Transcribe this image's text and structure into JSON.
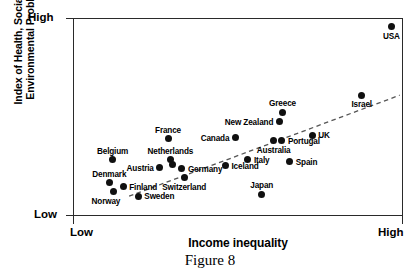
{
  "axes": {
    "y_title": "Index of Health, Social and\nEnvironmental Problems",
    "x_title": "Income inequality",
    "y_high": "High",
    "y_low": "Low",
    "x_low": "Low",
    "x_high": "High"
  },
  "caption": "Figure 8",
  "colors": {
    "point": "#101010",
    "frame": "#2a2a2a",
    "trend": "#555555",
    "background": "#ffffff"
  },
  "chart_data": {
    "type": "scatter",
    "title": "Figure 8",
    "xlabel": "Income inequality",
    "ylabel": "Index of Health, Social and Environmental Problems",
    "xlim": [
      "Low",
      "High"
    ],
    "ylim": [
      "Low",
      "High"
    ],
    "xtick_labels": [
      "Low",
      "High"
    ],
    "ytick_labels": [
      "Low",
      "High"
    ],
    "grid": false,
    "legend": "none",
    "trendline": {
      "type": "dashed-linear",
      "description": "Dashed positive regression line rising from lower-left to upper-right",
      "x0": 0.17,
      "y0": 0.1,
      "x1": 0.99,
      "y1": 0.61
    },
    "points": [
      {
        "name": "USA",
        "x": 0.965,
        "y": 0.955,
        "label_pos": "below"
      },
      {
        "name": "Israel",
        "x": 0.875,
        "y": 0.61,
        "label_pos": "below"
      },
      {
        "name": "Greece",
        "x": 0.635,
        "y": 0.525,
        "label_pos": "above"
      },
      {
        "name": "New Zealand",
        "x": 0.625,
        "y": 0.475,
        "label_pos": "left"
      },
      {
        "name": "UK",
        "x": 0.725,
        "y": 0.408,
        "label_pos": "right"
      },
      {
        "name": "Canada",
        "x": 0.492,
        "y": 0.395,
        "label_pos": "left"
      },
      {
        "name": "Australia",
        "x": 0.608,
        "y": 0.38,
        "label_pos": "below"
      },
      {
        "name": "Portugal",
        "x": 0.633,
        "y": 0.38,
        "label_pos": "right"
      },
      {
        "name": "France",
        "x": 0.288,
        "y": 0.39,
        "label_pos": "above"
      },
      {
        "name": "Netherlands",
        "x": 0.295,
        "y": 0.283,
        "label_pos": "above"
      },
      {
        "name": "Belgium",
        "x": 0.12,
        "y": 0.283,
        "label_pos": "above"
      },
      {
        "name": "Austria",
        "x": 0.263,
        "y": 0.243,
        "label_pos": "left"
      },
      {
        "name": "Germany",
        "x": 0.33,
        "y": 0.238,
        "label_pos": "right"
      },
      {
        "name": "Iceland",
        "x": 0.462,
        "y": 0.253,
        "label_pos": "right"
      },
      {
        "name": "Italy",
        "x": 0.53,
        "y": 0.283,
        "label_pos": "right"
      },
      {
        "name": "Spain",
        "x": 0.657,
        "y": 0.273,
        "label_pos": "right"
      },
      {
        "name": "Switzerland",
        "x": 0.337,
        "y": 0.192,
        "label_pos": "below"
      },
      {
        "name": "Denmark",
        "x": 0.11,
        "y": 0.168,
        "label_pos": "above"
      },
      {
        "name": "Finland",
        "x": 0.152,
        "y": 0.148,
        "label_pos": "right"
      },
      {
        "name": "Norway",
        "x": 0.122,
        "y": 0.122,
        "label_pos": "below-left"
      },
      {
        "name": "Sweden",
        "x": 0.198,
        "y": 0.1,
        "label_pos": "right"
      },
      {
        "name": "Japan",
        "x": 0.572,
        "y": 0.11,
        "label_pos": "above"
      },
      {
        "name": "unlabeled-mid",
        "x": 0.3,
        "y": 0.258,
        "label_pos": "none"
      }
    ]
  }
}
